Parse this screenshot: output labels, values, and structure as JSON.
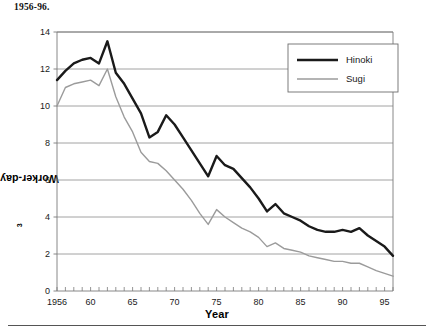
{
  "caption": {
    "clipped_line": "",
    "line": "1956-96."
  },
  "axes": {
    "y_title_text": "Worker-days per m",
    "y_title_exponent": "3",
    "x_title": "Year",
    "y_ticks": [
      "0",
      "2",
      "4",
      "6",
      "8",
      "10",
      "12",
      "14"
    ],
    "x_ticks": [
      "1956",
      "60",
      "65",
      "70",
      "75",
      "80",
      "85",
      "90",
      "95"
    ]
  },
  "legend": {
    "position": "top-right",
    "items": [
      {
        "label": "Hinoki",
        "color": "#1a1a1a",
        "width": 2.4
      },
      {
        "label": "Sugi",
        "color": "#9b9b9b",
        "width": 1.4
      }
    ]
  },
  "chart_data": {
    "type": "line",
    "title": "",
    "subtitle": "",
    "xlabel": "Year",
    "ylabel": "Worker-days per m3",
    "xlim": [
      1956,
      1996
    ],
    "ylim": [
      0,
      14
    ],
    "ytick_step": 2,
    "grid": "horizontal",
    "minor_x_ticks": "every year",
    "legend_position": "top-right",
    "x": [
      1956,
      1957,
      1958,
      1959,
      1960,
      1961,
      1962,
      1963,
      1964,
      1965,
      1966,
      1967,
      1968,
      1969,
      1970,
      1971,
      1972,
      1973,
      1974,
      1975,
      1976,
      1977,
      1978,
      1979,
      1980,
      1981,
      1982,
      1983,
      1984,
      1985,
      1986,
      1987,
      1988,
      1989,
      1990,
      1991,
      1992,
      1993,
      1994,
      1995,
      1996
    ],
    "series": [
      {
        "name": "Hinoki",
        "color": "#1a1a1a",
        "values": [
          11.4,
          11.9,
          12.3,
          12.5,
          12.6,
          12.3,
          13.5,
          11.8,
          11.2,
          10.4,
          9.6,
          8.3,
          8.6,
          9.5,
          9.0,
          8.3,
          7.6,
          6.9,
          6.2,
          7.3,
          6.8,
          6.6,
          6.1,
          5.6,
          5.0,
          4.3,
          4.7,
          4.2,
          4.0,
          3.8,
          3.5,
          3.3,
          3.2,
          3.2,
          3.3,
          3.2,
          3.4,
          3.0,
          2.7,
          2.4,
          1.9
        ]
      },
      {
        "name": "Sugi",
        "color": "#9b9b9b",
        "values": [
          10.0,
          11.0,
          11.2,
          11.3,
          11.4,
          11.1,
          12.0,
          10.5,
          9.4,
          8.6,
          7.5,
          7.0,
          6.9,
          6.5,
          6.0,
          5.5,
          4.9,
          4.2,
          3.6,
          4.4,
          4.0,
          3.7,
          3.4,
          3.2,
          2.9,
          2.4,
          2.6,
          2.3,
          2.2,
          2.1,
          1.9,
          1.8,
          1.7,
          1.6,
          1.6,
          1.5,
          1.5,
          1.3,
          1.1,
          0.95,
          0.8
        ]
      }
    ]
  },
  "style": {
    "grid_color": "#8c8c8c",
    "axis_color": "#7a7a7a",
    "plot_background": "#ffffff"
  }
}
